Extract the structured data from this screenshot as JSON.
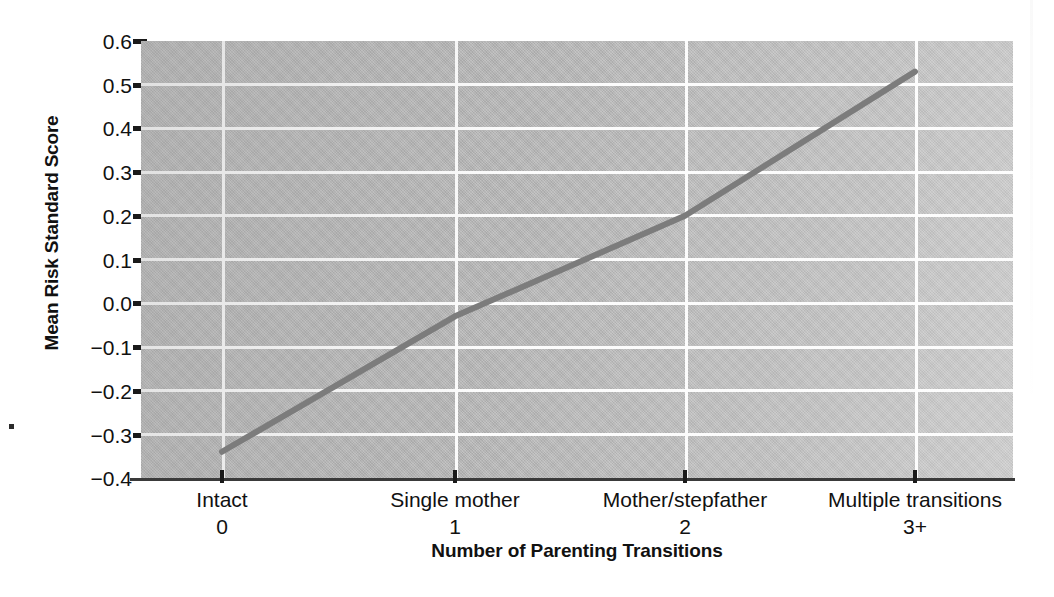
{
  "chart_data": {
    "type": "line",
    "title": "",
    "xlabel": "Number of Parenting Transitions",
    "ylabel": "Mean Risk Standard Score",
    "categories": [
      "Intact",
      "Single mother",
      "Mother/stepfather",
      "Multiple transitions"
    ],
    "category_values": [
      "0",
      "1",
      "2",
      "3+"
    ],
    "x": [
      0,
      1,
      2,
      3
    ],
    "values": [
      -0.34,
      -0.03,
      0.2,
      0.53
    ],
    "series": [
      {
        "name": "Mean Risk Standard Score",
        "values": [
          -0.34,
          -0.03,
          0.2,
          0.53
        ]
      }
    ],
    "ylim": [
      -0.4,
      0.6
    ],
    "yticks": [
      "0.6",
      "0.5",
      "0.4",
      "0.3",
      "0.2",
      "0.1",
      "0.0",
      "−0.1",
      "−0.2",
      "−0.3",
      "−0.4"
    ],
    "ytick_values": [
      0.6,
      0.5,
      0.4,
      0.3,
      0.2,
      0.1,
      0.0,
      -0.1,
      -0.2,
      -0.3,
      -0.4
    ],
    "grid": true,
    "grid_color": "#fcfcfc",
    "legend": null,
    "legend_position": "none",
    "plot_background_color": "#b8b8b8",
    "line_color": "#7c7c7c",
    "line_width": 6,
    "axis_color": "#1a1a1a",
    "text_color": "#111111",
    "page_background_color": "#ffffff"
  }
}
